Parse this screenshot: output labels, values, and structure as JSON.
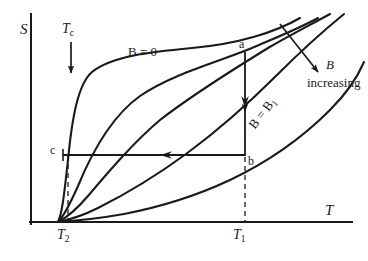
{
  "figure": {
    "type": "line",
    "background": "#ffffff",
    "ink_color": "#1a1a1a"
  },
  "axes": {
    "y_label": "S",
    "x_label": "T",
    "y_axis": {
      "x": 31,
      "y_top": 14,
      "y_bottom": 224
    },
    "x_axis": {
      "y": 222,
      "x_left": 31,
      "x_right": 352
    },
    "ticks": [
      {
        "name": "T2",
        "text": "T",
        "subscript": "2",
        "x": 68
      },
      {
        "name": "T1",
        "text": "T",
        "subscript": "1",
        "x": 245
      }
    ]
  },
  "annotations": {
    "tc_marker": {
      "label": "T",
      "subscript": "c",
      "arrow_x": 71,
      "arrow_y_start": 42,
      "arrow_y_end": 73
    },
    "curve_zero_field_label": {
      "text": "B = 0",
      "x": 128,
      "y": 45
    },
    "curve_b1_label": {
      "text": "B = B",
      "subscript": "1",
      "x": 252,
      "y": 120,
      "rotation_deg": -52
    },
    "b_increasing_label": {
      "line1": "B",
      "line2": "increasing",
      "x": 307,
      "y": 58
    },
    "b_increasing_arrow": {
      "x1": 280,
      "y1": 24,
      "x2": 318,
      "y2": 72
    },
    "points": [
      {
        "name": "a",
        "label": "a",
        "x": 245,
        "y": 52
      },
      {
        "name": "b",
        "label": "b",
        "x": 245,
        "y": 155
      },
      {
        "name": "c",
        "label": "c",
        "x": 63,
        "y": 155
      }
    ],
    "process_arrows": [
      {
        "name": "isothermal-magnetization",
        "from": "a",
        "to": "b",
        "direction": "down",
        "x": 245,
        "y1": 52,
        "y2": 155
      },
      {
        "name": "adiabatic-demagnetization",
        "from": "b",
        "to": "c",
        "direction": "left",
        "y": 155,
        "x1": 245,
        "x2": 63
      }
    ]
  },
  "chart_data": {
    "type": "line",
    "title": "",
    "xlabel": "T",
    "ylabel": "S",
    "grid": false,
    "legend": [
      "B = 0",
      "B = B1",
      "B increasing"
    ],
    "common_origin": {
      "x": 58,
      "y": 222
    },
    "series": [
      {
        "name": "B = 0",
        "path": "M58,222 C62,214 64,196 68,160 C72,118 78,84 92,72 C112,56 150,52 192,48 C238,44 276,32 300,18"
      },
      {
        "name": "B = B2",
        "path": "M58,222 C64,216 70,204 78,186 C92,152 112,116 140,96 C172,74 218,62 252,48 C280,36 300,28 318,18"
      },
      {
        "name": "B = B3",
        "path": "M58,222 C66,218 76,210 88,196 C110,170 134,142 160,120 C196,92 236,68 268,48 C292,34 312,24 330,14"
      },
      {
        "name": "B = B1",
        "path": "M58,222 C68,220 82,216 98,208 C126,194 156,176 186,154 C216,132 248,104 278,74 C300,52 322,32 344,14"
      },
      {
        "name": "B = B4",
        "path": "M58,222 C72,221 96,219 124,214 C160,207 196,196 230,180 C268,162 302,138 330,110 C348,92 358,76 364,62"
      }
    ]
  }
}
